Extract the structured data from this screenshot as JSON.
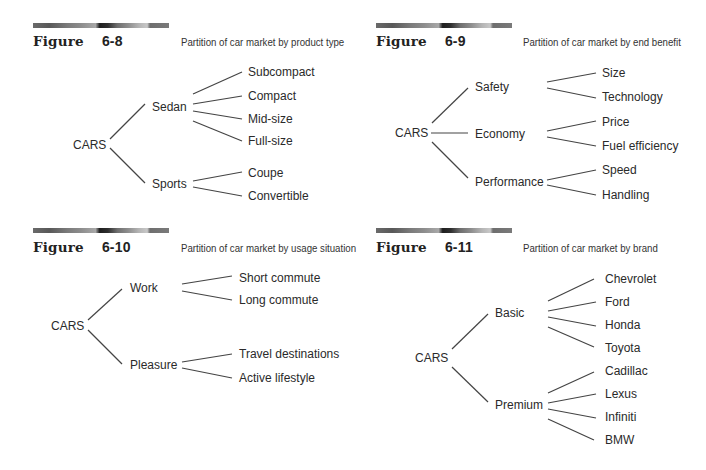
{
  "figures": [
    {
      "label": "Figure",
      "number": "6-8",
      "caption": "Partition of car market by product type",
      "root": "CARS",
      "branches": [
        {
          "label": "Sedan",
          "leaves": [
            "Subcompact",
            "Compact",
            "Mid-size",
            "Full-size"
          ]
        },
        {
          "label": "Sports",
          "leaves": [
            "Coupe",
            "Convertible"
          ]
        }
      ]
    },
    {
      "label": "Figure",
      "number": "6-9",
      "caption": "Partition of car market by end benefit",
      "root": "CARS",
      "branches": [
        {
          "label": "Safety",
          "leaves": [
            "Size",
            "Technology"
          ]
        },
        {
          "label": "Economy",
          "leaves": [
            "Price",
            "Fuel efficiency"
          ]
        },
        {
          "label": "Performance",
          "leaves": [
            "Speed",
            "Handling"
          ]
        }
      ]
    },
    {
      "label": "Figure",
      "number": "6-10",
      "caption": "Partition of car market by usage situation",
      "root": "CARS",
      "branches": [
        {
          "label": "Work",
          "leaves": [
            "Short commute",
            "Long commute"
          ]
        },
        {
          "label": "Pleasure",
          "leaves": [
            "Travel destinations",
            "Active lifestyle"
          ]
        }
      ]
    },
    {
      "label": "Figure",
      "number": "6-11",
      "caption": "Partition of car market by brand",
      "root": "CARS",
      "branches": [
        {
          "label": "Basic",
          "leaves": [
            "Chevrolet",
            "Ford",
            "Honda",
            "Toyota"
          ]
        },
        {
          "label": "Premium",
          "leaves": [
            "Cadillac",
            "Lexus",
            "Infiniti",
            "BMW"
          ]
        }
      ]
    }
  ],
  "colors": {
    "text": "#2a2a2a",
    "line": "#444444",
    "background": "#ffffff"
  }
}
